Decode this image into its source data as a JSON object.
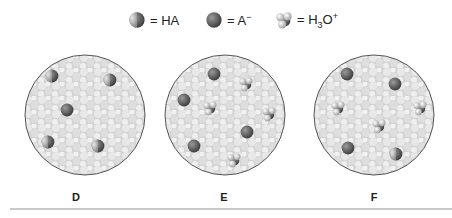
{
  "legend": {
    "items": [
      {
        "icon": "ha-molecule-icon",
        "symbol": "= HA"
      },
      {
        "icon": "a-minus-ion-icon",
        "symbol": "= A",
        "sup": "−"
      },
      {
        "icon": "hydronium-ion-icon",
        "symbol_pre": "= H",
        "sub": "3",
        "symbol_mid": "O",
        "sup": "+"
      }
    ]
  },
  "panels": [
    {
      "label": "D",
      "counts": {
        "HA": 4,
        "A-": 1,
        "H3O+": 0
      }
    },
    {
      "label": "E",
      "counts": {
        "HA": 0,
        "A-": 4,
        "H3O+": 4
      }
    },
    {
      "label": "F",
      "counts": {
        "HA": 1,
        "A-": 3,
        "H3O+": 3
      }
    }
  ],
  "colors": {
    "water": "#d8d8d8",
    "ion": "#5a5a5a",
    "border": "#555555"
  }
}
